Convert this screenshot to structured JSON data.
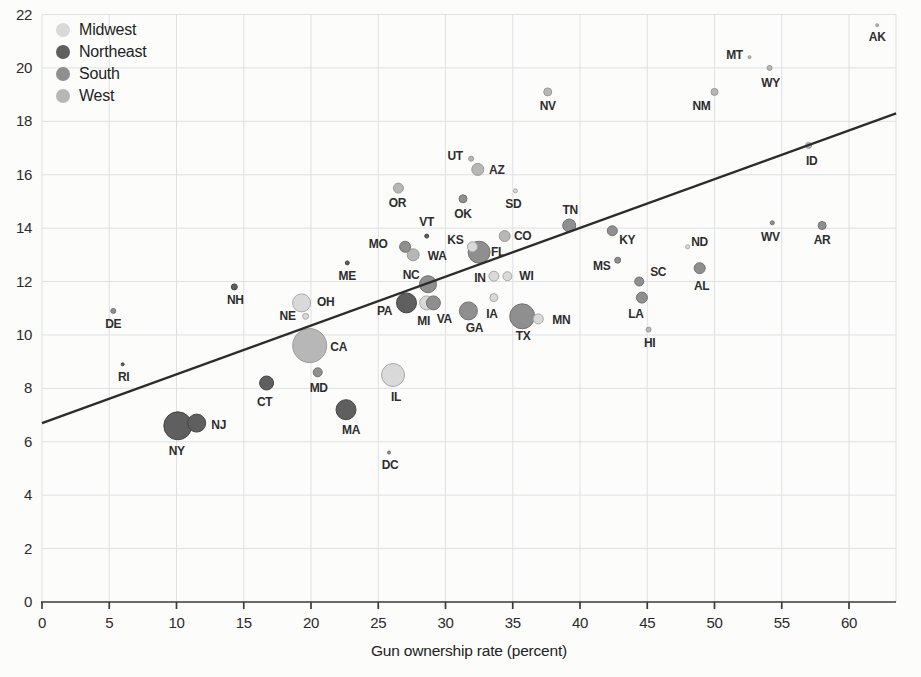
{
  "figure": {
    "background": "#fcfcfb",
    "grid_color": "#dfe0e4",
    "axis_color": "#3a3a3a",
    "text_color": "#2b2b2b"
  },
  "legend": {
    "items": [
      {
        "label": "Midwest",
        "color": "#d9d9d9"
      },
      {
        "label": "Northeast",
        "color": "#5f5f5f"
      },
      {
        "label": "South",
        "color": "#8f8f8f"
      },
      {
        "label": "West",
        "color": "#b7b7b7"
      }
    ]
  },
  "chart_data": {
    "type": "scatter",
    "title": "",
    "xlabel": "Gun ownership rate (percent)",
    "ylabel": "",
    "xlim": [
      0,
      63.5
    ],
    "ylim": [
      0,
      22
    ],
    "x_ticks": [
      0,
      5,
      10,
      15,
      20,
      25,
      30,
      35,
      40,
      45,
      50,
      55,
      60
    ],
    "y_ticks": [
      0,
      2,
      4,
      6,
      8,
      10,
      12,
      14,
      16,
      18,
      20,
      22
    ],
    "grid": true,
    "legend_position": "top-left",
    "regions": {
      "Midwest": {
        "fill": "#d9d9d9",
        "stroke": "#a9a9a9"
      },
      "Northeast": {
        "fill": "#5f5f5f",
        "stroke": "#474747"
      },
      "South": {
        "fill": "#8f8f8f",
        "stroke": "#737373"
      },
      "West": {
        "fill": "#b7b7b7",
        "stroke": "#9a9a9a"
      }
    },
    "trend_line": {
      "x1": 0,
      "y1": 6.7,
      "x2": 63.5,
      "y2": 18.3,
      "color": "#2c2c2c"
    },
    "points": [
      {
        "state": "AK",
        "region": "West",
        "x": 62.1,
        "y": 21.6,
        "r_px": 1.5,
        "label_dx": 0,
        "label_dy": 13
      },
      {
        "state": "MT",
        "region": "West",
        "x": 52.6,
        "y": 20.4,
        "r_px": 1.5,
        "label_dx": -15,
        "label_dy": -1
      },
      {
        "state": "WY",
        "region": "West",
        "x": 54.1,
        "y": 20.0,
        "r_px": 2.5,
        "label_dx": 1,
        "label_dy": 16
      },
      {
        "state": "NM",
        "region": "West",
        "x": 50.0,
        "y": 19.1,
        "r_px": 3.5,
        "label_dx": -13,
        "label_dy": 15
      },
      {
        "state": "NV",
        "region": "West",
        "x": 37.6,
        "y": 19.1,
        "r_px": 4,
        "label_dx": 0,
        "label_dy": 15
      },
      {
        "state": "ID",
        "region": "West",
        "x": 57.0,
        "y": 17.1,
        "r_px": 3,
        "label_dx": 3,
        "label_dy": 16
      },
      {
        "state": "UT",
        "region": "West",
        "x": 31.9,
        "y": 16.6,
        "r_px": 2.5,
        "label_dx": -16,
        "label_dy": -2
      },
      {
        "state": "AZ",
        "region": "West",
        "x": 32.4,
        "y": 16.2,
        "r_px": 6,
        "label_dx": 19,
        "label_dy": 1
      },
      {
        "state": "OR",
        "region": "West",
        "x": 26.5,
        "y": 15.5,
        "r_px": 5,
        "label_dx": -1,
        "label_dy": 16
      },
      {
        "state": "SD",
        "region": "Midwest",
        "x": 35.2,
        "y": 15.4,
        "r_px": 2,
        "label_dx": -2,
        "label_dy": 14
      },
      {
        "state": "OK",
        "region": "South",
        "x": 31.3,
        "y": 15.1,
        "r_px": 4,
        "label_dx": 0,
        "label_dy": 16
      },
      {
        "state": "WV",
        "region": "South",
        "x": 54.3,
        "y": 14.2,
        "r_px": 2,
        "label_dx": -2,
        "label_dy": 15
      },
      {
        "state": "AR",
        "region": "South",
        "x": 58.0,
        "y": 14.1,
        "r_px": 4,
        "label_dx": 0,
        "label_dy": 15
      },
      {
        "state": "TN",
        "region": "South",
        "x": 39.2,
        "y": 14.1,
        "r_px": 6.5,
        "label_dx": 1,
        "label_dy": -15
      },
      {
        "state": "KY",
        "region": "South",
        "x": 42.4,
        "y": 13.9,
        "r_px": 5,
        "label_dx": 15,
        "label_dy": 10
      },
      {
        "state": "VT",
        "region": "Northeast",
        "x": 28.6,
        "y": 13.7,
        "r_px": 2,
        "label_dx": 0,
        "label_dy": -13
      },
      {
        "state": "CO",
        "region": "West",
        "x": 34.4,
        "y": 13.7,
        "r_px": 5.5,
        "label_dx": 18,
        "label_dy": 1
      },
      {
        "state": "ND",
        "region": "Midwest",
        "x": 48.0,
        "y": 13.3,
        "r_px": 2,
        "label_dx": 12,
        "label_dy": -4
      },
      {
        "state": "MO",
        "region": "South",
        "x": 27.0,
        "y": 13.3,
        "r_px": 5.5,
        "label_dx": -27,
        "label_dy": -2
      },
      {
        "state": "KS",
        "region": "Midwest",
        "x": 32.0,
        "y": 13.3,
        "r_px": 5,
        "label_dx": -17,
        "label_dy": -6
      },
      {
        "state": "FL",
        "region": "South",
        "x": 32.5,
        "y": 13.1,
        "r_px": 11,
        "label_dx": 19,
        "label_dy": 1
      },
      {
        "state": "WA",
        "region": "West",
        "x": 27.6,
        "y": 13.0,
        "r_px": 6,
        "label_dx": 24,
        "label_dy": 2
      },
      {
        "state": "MS",
        "region": "South",
        "x": 42.8,
        "y": 12.8,
        "r_px": 3,
        "label_dx": -16,
        "label_dy": 7
      },
      {
        "state": "ME",
        "region": "Northeast",
        "x": 22.7,
        "y": 12.7,
        "r_px": 2,
        "label_dx": 0,
        "label_dy": 14
      },
      {
        "state": "AL",
        "region": "South",
        "x": 48.9,
        "y": 12.5,
        "r_px": 5.5,
        "label_dx": 2,
        "label_dy": 19
      },
      {
        "state": "IN",
        "region": "Midwest",
        "x": 33.6,
        "y": 12.2,
        "r_px": 5,
        "label_dx": -14,
        "label_dy": 3
      },
      {
        "state": "WI",
        "region": "Midwest",
        "x": 34.6,
        "y": 12.2,
        "r_px": 4.5,
        "label_dx": 19,
        "label_dy": 1
      },
      {
        "state": "SC",
        "region": "South",
        "x": 44.4,
        "y": 12.0,
        "r_px": 4.5,
        "label_dx": 19,
        "label_dy": -9
      },
      {
        "state": "NC",
        "region": "South",
        "x": 28.7,
        "y": 11.9,
        "r_px": 8.5,
        "label_dx": -17,
        "label_dy": -8
      },
      {
        "state": "NH",
        "region": "Northeast",
        "x": 14.3,
        "y": 11.8,
        "r_px": 3,
        "label_dx": 1,
        "label_dy": 14
      },
      {
        "state": "IA",
        "region": "Midwest",
        "x": 33.6,
        "y": 11.4,
        "r_px": 4,
        "label_dx": -2,
        "label_dy": 17
      },
      {
        "state": "LA",
        "region": "South",
        "x": 44.6,
        "y": 11.4,
        "r_px": 5.5,
        "label_dx": -6,
        "label_dy": 17
      },
      {
        "state": "PA",
        "region": "Northeast",
        "x": 27.1,
        "y": 11.2,
        "r_px": 10,
        "label_dx": -22,
        "label_dy": 9
      },
      {
        "state": "MI",
        "region": "Midwest",
        "x": 28.6,
        "y": 11.2,
        "r_px": 7,
        "label_dx": -3,
        "label_dy": 19
      },
      {
        "state": "VA",
        "region": "South",
        "x": 29.1,
        "y": 11.2,
        "r_px": 7,
        "label_dx": 11,
        "label_dy": 17
      },
      {
        "state": "OH",
        "region": "Midwest",
        "x": 19.3,
        "y": 11.2,
        "r_px": 9,
        "label_dx": 24,
        "label_dy": 0
      },
      {
        "state": "DE",
        "region": "South",
        "x": 5.3,
        "y": 10.9,
        "r_px": 2.5,
        "label_dx": 0,
        "label_dy": 14
      },
      {
        "state": "GA",
        "region": "South",
        "x": 31.7,
        "y": 10.9,
        "r_px": 9,
        "label_dx": 6,
        "label_dy": 18
      },
      {
        "state": "NE",
        "region": "Midwest",
        "x": 19.6,
        "y": 10.7,
        "r_px": 3,
        "label_dx": -18,
        "label_dy": 1
      },
      {
        "state": "TX",
        "region": "South",
        "x": 35.7,
        "y": 10.7,
        "r_px": 12.5,
        "label_dx": 1,
        "label_dy": 21
      },
      {
        "state": "MN",
        "region": "Midwest",
        "x": 36.9,
        "y": 10.6,
        "r_px": 5,
        "label_dx": 23,
        "label_dy": 2
      },
      {
        "state": "HI",
        "region": "West",
        "x": 45.1,
        "y": 10.2,
        "r_px": 2.5,
        "label_dx": 1,
        "label_dy": 14
      },
      {
        "state": "CA",
        "region": "West",
        "x": 19.9,
        "y": 9.6,
        "r_px": 17,
        "label_dx": 29,
        "label_dy": 2
      },
      {
        "state": "RI",
        "region": "Northeast",
        "x": 6.0,
        "y": 8.9,
        "r_px": 1.5,
        "label_dx": 1,
        "label_dy": 14
      },
      {
        "state": "MD",
        "region": "South",
        "x": 20.5,
        "y": 8.6,
        "r_px": 4.5,
        "label_dx": 1,
        "label_dy": 17
      },
      {
        "state": "IL",
        "region": "Midwest",
        "x": 26.1,
        "y": 8.5,
        "r_px": 11.5,
        "label_dx": 3,
        "label_dy": 23
      },
      {
        "state": "CT",
        "region": "Northeast",
        "x": 16.7,
        "y": 8.2,
        "r_px": 7,
        "label_dx": -2,
        "label_dy": 20
      },
      {
        "state": "MA",
        "region": "Northeast",
        "x": 22.6,
        "y": 7.2,
        "r_px": 10,
        "label_dx": 5,
        "label_dy": 21
      },
      {
        "state": "NJ",
        "region": "Northeast",
        "x": 11.5,
        "y": 6.7,
        "r_px": 9,
        "label_dx": 22,
        "label_dy": 3
      },
      {
        "state": "NY",
        "region": "Northeast",
        "x": 10.1,
        "y": 6.6,
        "r_px": 14,
        "label_dx": -1,
        "label_dy": 26
      },
      {
        "state": "DC",
        "region": "South",
        "x": 25.8,
        "y": 5.6,
        "r_px": 1.5,
        "label_dx": 1,
        "label_dy": 13
      }
    ]
  }
}
